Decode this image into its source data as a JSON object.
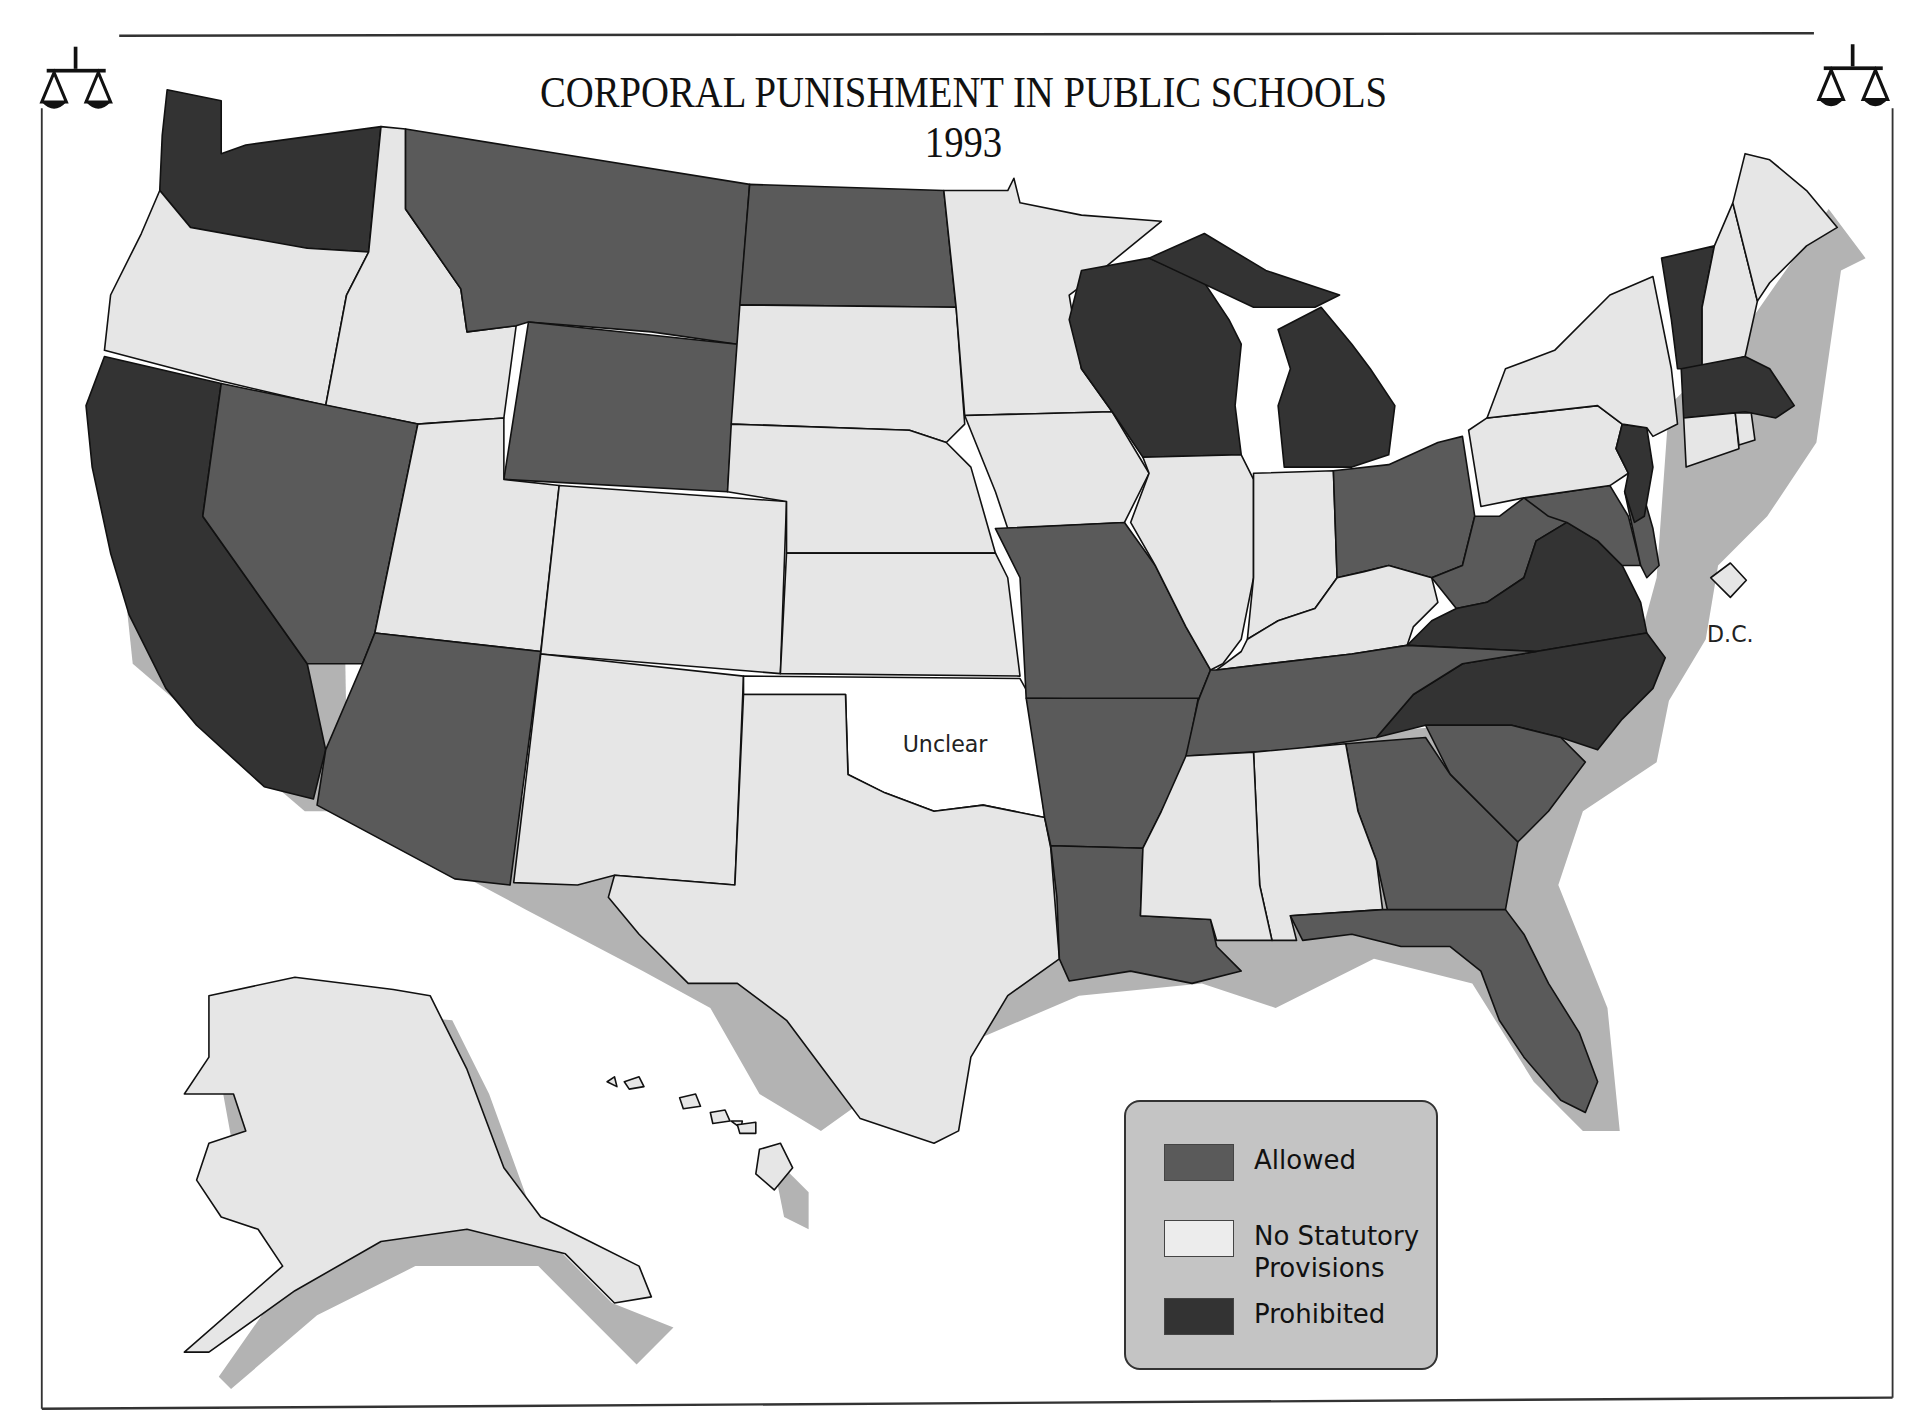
{
  "title": {
    "line1": "CORPORAL PUNISHMENT IN PUBLIC SCHOOLS",
    "line2": "1993"
  },
  "icons": {
    "left": "scales-of-justice-icon",
    "right": "scales-of-justice-icon"
  },
  "colors": {
    "allowed": "#5a5a5a",
    "no_statutory_provisions": "#e6e6e6",
    "prohibited": "#333333",
    "unclear": "#ffffff",
    "legend_background": "#c4c4c4",
    "shadow": "#b3b3b3"
  },
  "labels": {
    "oklahoma": "Unclear",
    "dc": "D.C."
  },
  "legend": {
    "items": [
      {
        "label": "Allowed",
        "category": "allowed"
      },
      {
        "label_line1": "No Statutory",
        "label_line2": "Provisions",
        "category": "no_statutory_provisions"
      },
      {
        "label": "Prohibited",
        "category": "prohibited"
      }
    ]
  },
  "states": {
    "allowed": [
      "Montana",
      "North Dakota",
      "Wyoming",
      "Nevada",
      "Arizona",
      "Missouri",
      "Arkansas",
      "Louisiana",
      "Tennessee",
      "Georgia",
      "South Carolina",
      "Florida",
      "Ohio",
      "West Virginia",
      "Maryland",
      "Delaware"
    ],
    "no_statutory_provisions": [
      "Oregon",
      "Idaho",
      "Utah",
      "Colorado",
      "New Mexico",
      "Texas",
      "South Dakota",
      "Nebraska",
      "Kansas",
      "Minnesota",
      "Iowa",
      "Illinois",
      "Indiana",
      "Kentucky",
      "Mississippi",
      "Alabama",
      "Pennsylvania",
      "New York",
      "New Hampshire",
      "Maine",
      "Connecticut",
      "Rhode Island",
      "Alaska",
      "Hawaii",
      "District of Columbia"
    ],
    "prohibited": [
      "Washington",
      "California",
      "Wisconsin",
      "Michigan",
      "Virginia",
      "North Carolina",
      "Vermont",
      "Massachusetts",
      "New Jersey"
    ],
    "unclear": [
      "Oklahoma"
    ]
  }
}
